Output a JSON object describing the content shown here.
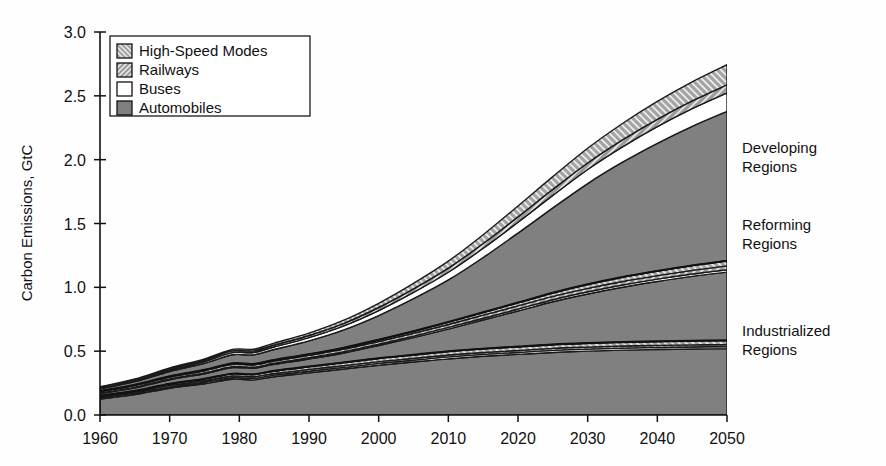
{
  "chart_data": {
    "type": "area",
    "title": "",
    "subtitle": "",
    "xlabel": "",
    "ylabel": "Carbon Emissions, GtC",
    "xlim": [
      1960,
      2050
    ],
    "ylim": [
      0.0,
      3.0
    ],
    "grid": false,
    "stacked": true,
    "legend_position": "top-left",
    "x": [
      1960,
      1965,
      1970,
      1975,
      1979,
      1982,
      1985,
      1990,
      1995,
      2000,
      2005,
      2010,
      2015,
      2020,
      2025,
      2030,
      2035,
      2040,
      2045,
      2050
    ],
    "xticks": [
      "1960",
      "1970",
      "1980",
      "1990",
      "2000",
      "2010",
      "2020",
      "2030",
      "2040",
      "2050"
    ],
    "yticks": [
      "0.0",
      "0.5",
      "1.0",
      "1.5",
      "2.0",
      "2.5",
      "3.0"
    ],
    "legend": [
      {
        "label": "High-Speed Modes",
        "pattern": "backslash-hatch",
        "color": "#9a9a9a"
      },
      {
        "label": "Railways",
        "pattern": "slash-hatch",
        "color": "#8f8f8f"
      },
      {
        "label": "Buses",
        "pattern": "solid-white",
        "color": "#ffffff"
      },
      {
        "label": "Automobiles",
        "pattern": "solid-gray",
        "color": "#808080"
      }
    ],
    "annotations": [
      {
        "text": "Developing Regions",
        "x": 2052,
        "y": 2.05
      },
      {
        "text": "Reforming Regions",
        "x": 2052,
        "y": 1.45
      },
      {
        "text": "Industrialized Regions",
        "x": 2052,
        "y": 0.62
      }
    ],
    "groups": [
      {
        "name": "Industrialized Regions",
        "series": [
          {
            "name": "Automobiles",
            "pattern": "solid-gray",
            "values": [
              0.125,
              0.16,
              0.21,
              0.245,
              0.28,
              0.275,
              0.3,
              0.33,
              0.36,
              0.39,
              0.415,
              0.44,
              0.46,
              0.475,
              0.49,
              0.5,
              0.508,
              0.513,
              0.517,
              0.52
            ]
          },
          {
            "name": "Buses",
            "pattern": "solid-white",
            "values": [
              0.008,
              0.009,
              0.01,
              0.011,
              0.012,
              0.012,
              0.012,
              0.013,
              0.013,
              0.014,
              0.014,
              0.015,
              0.015,
              0.015,
              0.016,
              0.016,
              0.016,
              0.016,
              0.016,
              0.016
            ]
          },
          {
            "name": "Railways",
            "pattern": "slash-hatch",
            "values": [
              0.01,
              0.011,
              0.012,
              0.012,
              0.013,
              0.013,
              0.013,
              0.014,
              0.014,
              0.014,
              0.015,
              0.015,
              0.015,
              0.015,
              0.016,
              0.016,
              0.016,
              0.016,
              0.016,
              0.016
            ]
          },
          {
            "name": "High-Speed Modes",
            "pattern": "backslash-hatch",
            "values": [
              0.007,
              0.009,
              0.012,
              0.015,
              0.018,
              0.018,
              0.02,
              0.022,
              0.024,
              0.026,
              0.027,
              0.028,
              0.029,
              0.03,
              0.03,
              0.031,
              0.031,
              0.031,
              0.032,
              0.032
            ]
          }
        ]
      },
      {
        "name": "Reforming Regions",
        "series": [
          {
            "name": "Automobiles",
            "pattern": "solid-gray",
            "values": [
              0.018,
              0.024,
              0.032,
              0.04,
              0.048,
              0.048,
              0.052,
              0.06,
              0.075,
              0.1,
              0.135,
              0.175,
              0.225,
              0.28,
              0.335,
              0.385,
              0.43,
              0.47,
              0.505,
              0.535
            ]
          },
          {
            "name": "Buses",
            "pattern": "solid-white",
            "values": [
              0.004,
              0.005,
              0.006,
              0.007,
              0.008,
              0.008,
              0.008,
              0.009,
              0.01,
              0.011,
              0.012,
              0.013,
              0.014,
              0.015,
              0.016,
              0.017,
              0.017,
              0.018,
              0.018,
              0.019
            ]
          },
          {
            "name": "Railways",
            "pattern": "slash-hatch",
            "values": [
              0.012,
              0.014,
              0.016,
              0.017,
              0.018,
              0.018,
              0.018,
              0.019,
              0.02,
              0.021,
              0.022,
              0.023,
              0.024,
              0.025,
              0.026,
              0.027,
              0.028,
              0.028,
              0.029,
              0.03
            ]
          },
          {
            "name": "High-Speed Modes",
            "pattern": "backslash-hatch",
            "values": [
              0.003,
              0.004,
              0.005,
              0.006,
              0.007,
              0.007,
              0.008,
              0.009,
              0.011,
              0.013,
              0.016,
              0.019,
              0.022,
              0.025,
              0.028,
              0.031,
              0.034,
              0.036,
              0.038,
              0.04
            ]
          }
        ]
      },
      {
        "name": "Developing Regions",
        "series": [
          {
            "name": "Automobiles",
            "pattern": "solid-gray",
            "values": [
              0.018,
              0.026,
              0.038,
              0.052,
              0.068,
              0.072,
              0.082,
              0.105,
              0.14,
              0.19,
              0.255,
              0.33,
              0.43,
              0.545,
              0.665,
              0.79,
              0.9,
              1.0,
              1.09,
              1.17
            ]
          },
          {
            "name": "Buses",
            "pattern": "solid-white",
            "values": [
              0.006,
              0.008,
              0.011,
              0.014,
              0.017,
              0.018,
              0.02,
              0.025,
              0.031,
              0.039,
              0.049,
              0.06,
              0.072,
              0.085,
              0.098,
              0.11,
              0.12,
              0.13,
              0.138,
              0.145
            ]
          },
          {
            "name": "Railways",
            "pattern": "slash-hatch",
            "values": [
              0.006,
              0.007,
              0.009,
              0.011,
              0.013,
              0.013,
              0.015,
              0.017,
              0.02,
              0.024,
              0.028,
              0.032,
              0.037,
              0.042,
              0.047,
              0.051,
              0.055,
              0.058,
              0.061,
              0.063
            ]
          },
          {
            "name": "High-Speed Modes",
            "pattern": "backslash-hatch",
            "values": [
              0.004,
              0.005,
              0.007,
              0.009,
              0.012,
              0.013,
              0.015,
              0.019,
              0.025,
              0.033,
              0.043,
              0.055,
              0.069,
              0.085,
              0.1,
              0.115,
              0.128,
              0.14,
              0.15,
              0.158
            ]
          }
        ]
      }
    ],
    "totals_note": "",
    "band_separator_color": "#1a1a1a"
  }
}
